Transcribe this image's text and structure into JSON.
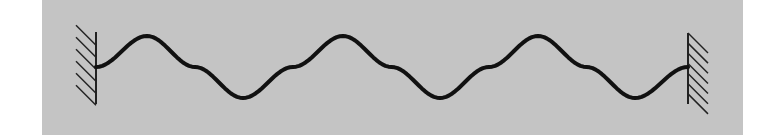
{
  "diagram": {
    "type": "standing-wave-on-string",
    "canvas": {
      "width": 780,
      "height": 137
    },
    "colors": {
      "page_background": "#ffffff",
      "panel_background": "#c4c4c4",
      "wave_stroke": "#111111",
      "wall_stroke": "#222222"
    },
    "panel": {
      "x": 42,
      "y": 0,
      "width": 701,
      "height": 135
    },
    "left_wall": {
      "x": 96,
      "y_top": 32,
      "y_bottom": 104,
      "hatch_side": "left",
      "hatch_count": 6
    },
    "right_wall": {
      "x": 688,
      "y_top": 33,
      "y_bottom": 104,
      "hatch_side": "right",
      "hatch_count": 7
    },
    "wave": {
      "x_start": 96,
      "x_end": 688,
      "y_center": 67,
      "amplitude": 31,
      "peaks_x": [
        147,
        343,
        538
      ],
      "troughs_x": [
        243,
        440,
        635
      ],
      "stroke_width": 4
    }
  }
}
